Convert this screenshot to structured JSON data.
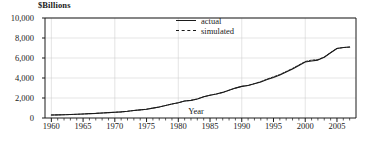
{
  "chart_data": {
    "type": "line",
    "title": "",
    "xlabel": "Year",
    "ylabel": "$Billions",
    "y_unit_caption": "$Billions",
    "xlim": [
      1959,
      2008
    ],
    "ylim": [
      0,
      10000
    ],
    "grid": true,
    "legend_position": "top-center",
    "y_ticks": [
      0,
      2000,
      4000,
      6000,
      8000,
      10000
    ],
    "y_tick_labels": [
      "0",
      "2,000",
      "4,000",
      "6,000",
      "8,000",
      "10,000"
    ],
    "x_ticks": [
      1960,
      1965,
      1970,
      1975,
      1980,
      1985,
      1990,
      1995,
      2000,
      2005
    ],
    "x_tick_labels": [
      "1960",
      "1965",
      "1970",
      "1975",
      "1980",
      "1985",
      "1990",
      "1995",
      "2000",
      "2005"
    ],
    "x_minor_tick_interval": 1,
    "x": [
      1960,
      1961,
      1962,
      1963,
      1964,
      1965,
      1966,
      1967,
      1968,
      1969,
      1970,
      1971,
      1972,
      1973,
      1974,
      1975,
      1976,
      1977,
      1978,
      1979,
      1980,
      1981,
      1982,
      1983,
      1984,
      1985,
      1986,
      1987,
      1988,
      1989,
      1990,
      1991,
      1992,
      1993,
      1994,
      1995,
      1996,
      1997,
      1998,
      1999,
      2000,
      2001,
      2002,
      2003,
      2004,
      2005,
      2006,
      2007
    ],
    "series": [
      {
        "name": "actual",
        "style": "solid",
        "color": "#1a1a1a",
        "values": [
          300,
          310,
          330,
          345,
          370,
          400,
          435,
          460,
          500,
          540,
          570,
          610,
          670,
          750,
          810,
          880,
          990,
          1100,
          1250,
          1400,
          1520,
          1700,
          1760,
          1900,
          2120,
          2280,
          2400,
          2560,
          2780,
          2990,
          3160,
          3250,
          3420,
          3600,
          3840,
          4060,
          4300,
          4600,
          4900,
          5250,
          5600,
          5700,
          5790,
          6080,
          6520,
          6950,
          7050,
          7100
        ]
      },
      {
        "name": "simulated",
        "style": "dashed",
        "color": "#1a1a1a",
        "values": [
          300,
          310,
          330,
          345,
          370,
          400,
          435,
          460,
          500,
          540,
          570,
          610,
          670,
          750,
          810,
          880,
          990,
          1100,
          1250,
          1400,
          1520,
          1700,
          1760,
          1900,
          2120,
          2280,
          2400,
          2560,
          2780,
          2990,
          3160,
          3260,
          3440,
          3640,
          3890,
          4120,
          4350,
          4650,
          4960,
          5300,
          5650,
          5790,
          5840,
          6100,
          6540,
          6960,
          7040,
          7090
        ]
      }
    ],
    "legend": [
      {
        "label": "actual",
        "style": "solid"
      },
      {
        "label": "simulated",
        "style": "dashed"
      }
    ]
  }
}
